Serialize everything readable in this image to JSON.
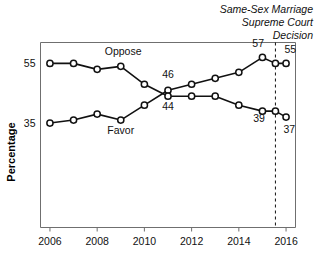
{
  "chart_data": {
    "type": "line",
    "title": "",
    "xlabel": "",
    "ylabel": "Percentage",
    "xlim": [
      2005.6,
      2016.4
    ],
    "ylim": [
      0,
      62
    ],
    "grid": false,
    "legend_position": "inline-labels",
    "x_tick_labels": [
      "2006",
      "2008",
      "2010",
      "2012",
      "2014",
      "2016"
    ],
    "x_ticks": [
      2006,
      2008,
      2010,
      2012,
      2014,
      2016
    ],
    "y_tick_labels": [
      "55",
      "35"
    ],
    "y_ticks": [
      55,
      35
    ],
    "series": [
      {
        "name": "Favor",
        "x": [
          2006,
          2007,
          2008,
          2009,
          2010,
          2011,
          2012,
          2013,
          2014,
          2015,
          2015.55,
          2016
        ],
        "values": [
          35,
          36,
          38,
          36,
          41,
          46,
          48,
          50,
          52,
          57,
          55,
          55
        ]
      },
      {
        "name": "Oppose",
        "x": [
          2006,
          2007,
          2008,
          2009,
          2010,
          2011,
          2012,
          2013,
          2014,
          2015,
          2015.55,
          2016
        ],
        "values": [
          55,
          55,
          53,
          54,
          48,
          44,
          44,
          44,
          41,
          39,
          39,
          37
        ]
      }
    ],
    "series_labels": [
      {
        "text": "Oppose",
        "x": 2009.1,
        "y": 57.8
      },
      {
        "text": "Favor",
        "x": 2009.0,
        "y": 31.5
      }
    ],
    "point_labels": [
      {
        "text": "46",
        "x": 2011.0,
        "y": 50.0
      },
      {
        "text": "44",
        "x": 2011.0,
        "y": 39.5
      },
      {
        "text": "57",
        "x": 2014.82,
        "y": 60.4
      },
      {
        "text": "55",
        "x": 2016.18,
        "y": 58.6
      },
      {
        "text": "39",
        "x": 2014.86,
        "y": 35.4
      },
      {
        "text": "37",
        "x": 2016.14,
        "y": 31.8
      }
    ],
    "annotations": [
      {
        "name": "supreme-court-decision",
        "lines": [
          "Same-Sex Marriage",
          "Supreme Court",
          "Decision"
        ],
        "at_x": 2015.55,
        "style": "italic",
        "marker": "dashed-vertical-line"
      }
    ],
    "colors": {
      "line": "#111111",
      "marker_fill": "#ffffff",
      "frame": "#6f6f6f",
      "text": "#111111",
      "background": "#ffffff"
    }
  }
}
